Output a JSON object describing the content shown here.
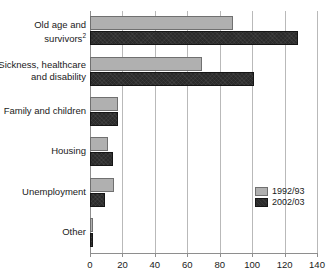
{
  "chart_data": {
    "type": "bar",
    "orientation": "horizontal",
    "title": "",
    "xlabel": "",
    "ylabel": "",
    "xlim": [
      0,
      140
    ],
    "xticks": [
      0,
      20,
      40,
      60,
      80,
      100,
      120,
      140
    ],
    "grid": true,
    "legend_position": "right-inner",
    "categories": [
      "Old age and\nsurvivors",
      "Sickness, healthcare\nand disability",
      "Family and children",
      "Housing",
      "Unemployment",
      "Other"
    ],
    "category_footnotes": [
      "2",
      "",
      "",
      "",
      "",
      ""
    ],
    "series": [
      {
        "name": "1992/93",
        "color": "#b0b0b0",
        "values": [
          88,
          69,
          17,
          11,
          15,
          1
        ]
      },
      {
        "name": "2002/03",
        "color": "#2b2b2b",
        "values": [
          128,
          101,
          17,
          14,
          9,
          2
        ]
      }
    ]
  },
  "legend": {
    "entries": [
      {
        "label": "1992/93"
      },
      {
        "label": "2002/03"
      }
    ]
  }
}
